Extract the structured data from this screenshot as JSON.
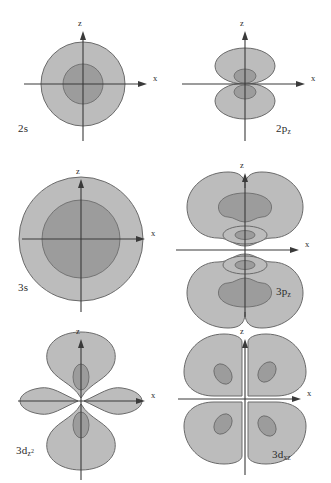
{
  "figure": {
    "background_color": "#ffffff",
    "outer_fill_color": "#bcbcbc",
    "inner_fill_color": "#9c9c9c",
    "outline_color": "#6a6a6a",
    "axis_color": "#3a3a3a",
    "text_color": "#2b2b2b",
    "columns": 2,
    "rows": 3
  },
  "axes": {
    "vertical_label": "z",
    "horizontal_label": "x"
  },
  "orbitals": [
    {
      "id": "2s",
      "label_prefix": "2",
      "label_symbol": "s",
      "label_subscript": "",
      "label_text": "2s",
      "shape": "concentric-circles",
      "regions": 2,
      "nodes": 1,
      "axis_labels": {
        "vertical": "z",
        "horizontal": "x"
      }
    },
    {
      "id": "2pz",
      "label_prefix": "2",
      "label_symbol": "p",
      "label_subscript": "z",
      "label_text": "2pz",
      "shape": "two-lobes-vertical",
      "regions": 2,
      "nodes": 1,
      "axis_labels": {
        "vertical": "z",
        "horizontal": "x"
      }
    },
    {
      "id": "3s",
      "label_prefix": "3",
      "label_symbol": "s",
      "label_subscript": "",
      "label_text": "3s",
      "shape": "concentric-circles",
      "regions": 2,
      "nodes": 2,
      "axis_labels": {
        "vertical": "z",
        "horizontal": "x"
      }
    },
    {
      "id": "3pz",
      "label_prefix": "3",
      "label_symbol": "p",
      "label_subscript": "z",
      "label_text": "3pz",
      "shape": "two-kidney-lobes-with-inner-rings",
      "regions": 4,
      "nodes": 2,
      "axis_labels": {
        "vertical": "z",
        "horizontal": "x"
      }
    },
    {
      "id": "3dz2",
      "label_prefix": "3",
      "label_symbol": "d",
      "label_subscript": "z",
      "label_superscript": "2",
      "label_text": "3dz2",
      "shape": "dz2-two-vertical-lobes-two-side-lobes",
      "regions": 4,
      "nodes": 2,
      "axis_labels": {
        "vertical": "z",
        "horizontal": "x"
      }
    },
    {
      "id": "3dxz",
      "label_prefix": "3",
      "label_symbol": "d",
      "label_subscript": "xz",
      "label_text": "3dxz",
      "shape": "four-lobes-quadrants",
      "regions": 4,
      "nodes": 2,
      "axis_labels": {
        "vertical": "z",
        "horizontal": "x"
      }
    }
  ]
}
